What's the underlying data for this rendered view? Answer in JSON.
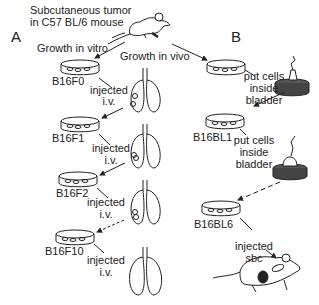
{
  "panels": {
    "a": {
      "letter": "A"
    },
    "b": {
      "letter": "B"
    }
  },
  "header": {
    "line1": "Subcutaneous tumor",
    "line2": "in C57 BL/6 mouse"
  },
  "flows": {
    "vitro": "Growth in vitro",
    "vivo": "Growth in vivo"
  },
  "cell_lines_a": [
    "B16F0",
    "B16F1",
    "B16F2",
    "B16F10"
  ],
  "cell_lines_b": [
    "B16BL1",
    "B16BL6"
  ],
  "steps_a": {
    "inj1_l1": "injected",
    "inj1_l2": "i.v.",
    "inj2_l1": "injected",
    "inj2_l2": "i.v.",
    "inj3_l1": "injected",
    "inj3_l2": "i.v.",
    "inj4_l1": "injected",
    "inj4_l2": "i.v."
  },
  "steps_b": {
    "put1_l1": "put cells",
    "put1_l2": "inside",
    "put1_l3": "bladder",
    "put2_l1": "put cells",
    "put2_l2": "inside",
    "put2_l3": "bladder",
    "sbc_l1": "injected",
    "sbc_l2": "sbc"
  },
  "colors": {
    "ink": "#222222",
    "background": "#ffffff"
  }
}
